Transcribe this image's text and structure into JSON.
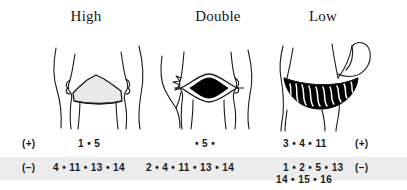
{
  "figure": {
    "columns": [
      {
        "id": "high",
        "header": "High",
        "drawing": "pelvis-front-view-high-band",
        "band_fill": "#e9e9e9"
      },
      {
        "id": "double",
        "header": "Double",
        "drawing": "pelvis-front-view-double-lens",
        "band_fill": "#000000"
      },
      {
        "id": "low",
        "header": "Low",
        "drawing": "pelvis-side-view-low-sash",
        "band_fill": "#000000"
      }
    ],
    "rows": [
      {
        "id": "positive",
        "sign_left": "(+)",
        "sign_right": "(+)",
        "values": {
          "high": "1 • 5",
          "double": "• 5 •",
          "low": "3 • 4 • 11",
          "low_continued": ""
        }
      },
      {
        "id": "negative",
        "sign_left": "(−)",
        "sign_right": "(−)",
        "values": {
          "high": "4 • 11 • 13 • 14",
          "double": "2 •  4 • 11 • 13 • 14",
          "low": "1 • 2 • 5 • 13",
          "low_continued": "14 • 15 • 16"
        }
      }
    ],
    "colors": {
      "ink": "#1a1a1a",
      "highlight_band": "#ececec",
      "shade_light": "#e9e9e9",
      "shade_dark": "#000000",
      "background": "#ffffff"
    }
  }
}
